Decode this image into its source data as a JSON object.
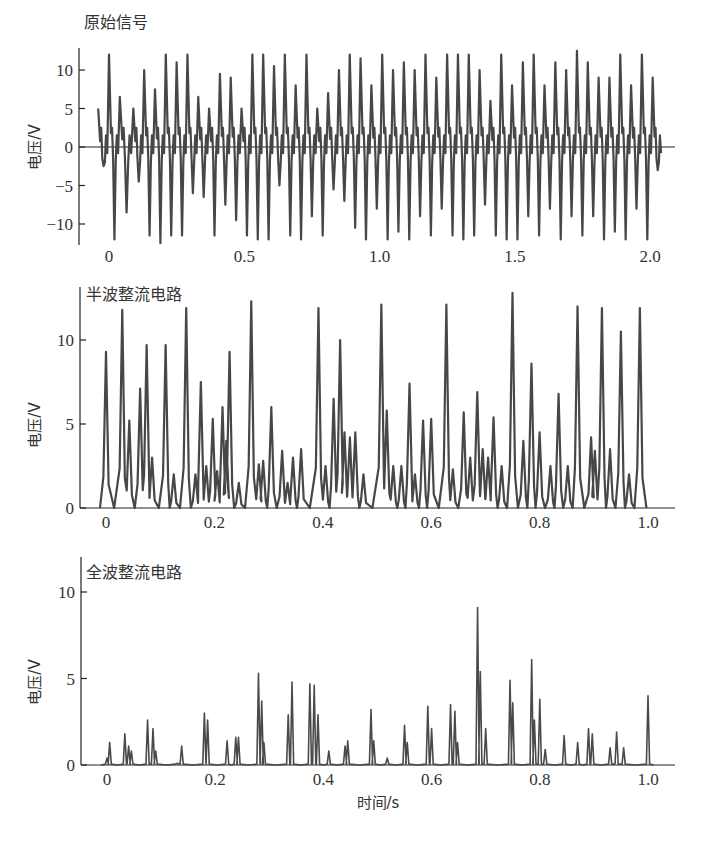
{
  "chart_data": [
    {
      "type": "line",
      "title": "原始信号",
      "xlabel": "",
      "ylabel": "电压/V",
      "xticks": [
        "0",
        "0.5",
        "1.0",
        "1.5",
        "2.0"
      ],
      "xtick_values": [
        0,
        0.5,
        1.0,
        1.5,
        2.0
      ],
      "yticks": [
        "10",
        "5",
        "0",
        "−5",
        "−10"
      ],
      "ytick_values": [
        10,
        5,
        0,
        -5,
        -10
      ],
      "xlim": [
        -0.07,
        2.07
      ],
      "ylim": [
        -13,
        13
      ],
      "grid": false,
      "zero_line": true,
      "series": [
        {
          "name": "原始信号",
          "description": "Oscillating raw voltage signal between about -12 V and +12.5 V over 0–2.0 s",
          "peaks_x": [
            -0.04,
            0.0,
            0.04,
            0.09,
            0.13,
            0.17,
            0.21,
            0.25,
            0.29,
            0.33,
            0.37,
            0.41,
            0.45,
            0.49,
            0.53,
            0.57,
            0.61,
            0.65,
            0.69,
            0.73,
            0.77,
            0.81,
            0.85,
            0.89,
            0.93,
            0.97,
            1.01,
            1.05,
            1.09,
            1.13,
            1.17,
            1.21,
            1.25,
            1.29,
            1.33,
            1.37,
            1.41,
            1.45,
            1.49,
            1.53,
            1.57,
            1.61,
            1.65,
            1.69,
            1.73,
            1.77,
            1.81,
            1.85,
            1.89,
            1.93,
            1.97,
            2.01
          ],
          "peaks_y": [
            5,
            12,
            6.5,
            5,
            10,
            7.5,
            12,
            11,
            12,
            6.5,
            5,
            9.5,
            9,
            5,
            12,
            12,
            10.5,
            12,
            8,
            12,
            5,
            7,
            10,
            12,
            11.5,
            8,
            12,
            10,
            11,
            10,
            12,
            9,
            12,
            12,
            12,
            10,
            6,
            12,
            8,
            11,
            12,
            8,
            11,
            10,
            12.5,
            11,
            9,
            9,
            12,
            8,
            12,
            9
          ],
          "troughs_y": [
            -2.5,
            -12,
            -8.5,
            -4.5,
            -11.5,
            -12.5,
            -11.5,
            -11.5,
            -6,
            -6.5,
            -11.5,
            -7.5,
            -9.5,
            -11.5,
            -12,
            -12,
            -5,
            -11.5,
            -12,
            -9,
            -11.5,
            -5.5,
            -7,
            -10.5,
            -12,
            -8,
            -12,
            -11,
            -12,
            -9,
            -11.5,
            -8,
            -11.5,
            -12,
            -11.5,
            -7.5,
            -11.5,
            -12,
            -12,
            -9,
            -11.5,
            -8,
            -12,
            -9,
            -11.5,
            -9,
            -12,
            -11,
            -12,
            -8,
            -12,
            -3
          ]
        }
      ]
    },
    {
      "type": "line",
      "title": "半波整流电路",
      "xlabel": "",
      "ylabel": "电压/V",
      "xticks": [
        "0",
        "0.2",
        "0.4",
        "0.6",
        "0.8",
        "1.0"
      ],
      "xtick_values": [
        0,
        0.2,
        0.4,
        0.6,
        0.8,
        1.0
      ],
      "yticks": [
        "10",
        "5",
        "0"
      ],
      "ytick_values": [
        10,
        5,
        0
      ],
      "xlim": [
        -0.05,
        1.05
      ],
      "ylim": [
        0,
        12.8
      ],
      "grid": false,
      "series": [
        {
          "name": "半波整流输出",
          "peaks_x": [
            0.0,
            0.03,
            0.043,
            0.063,
            0.075,
            0.085,
            0.11,
            0.125,
            0.148,
            0.165,
            0.175,
            0.185,
            0.197,
            0.205,
            0.215,
            0.222,
            0.228,
            0.245,
            0.268,
            0.282,
            0.29,
            0.305,
            0.325,
            0.335,
            0.345,
            0.36,
            0.392,
            0.405,
            0.42,
            0.432,
            0.44,
            0.45,
            0.46,
            0.475,
            0.508,
            0.518,
            0.53,
            0.545,
            0.56,
            0.57,
            0.585,
            0.6,
            0.628,
            0.64,
            0.66,
            0.672,
            0.685,
            0.695,
            0.705,
            0.715,
            0.73,
            0.75,
            0.77,
            0.785,
            0.8,
            0.82,
            0.835,
            0.852,
            0.87,
            0.895,
            0.902,
            0.915,
            0.93,
            0.95,
            0.965,
            0.985
          ],
          "peaks_y": [
            9.3,
            11.8,
            5.2,
            7.1,
            9.7,
            3,
            9.7,
            2,
            11.9,
            2,
            7.5,
            2.5,
            5.3,
            2.2,
            6,
            4,
            9.3,
            1.5,
            12.3,
            2.6,
            2.8,
            6,
            3.4,
            1.5,
            3,
            3.5,
            11.9,
            2.5,
            6.5,
            10,
            4.5,
            4.2,
            4.5,
            2,
            12.1,
            5.8,
            2.5,
            2.5,
            7.4,
            2,
            5.2,
            5.3,
            12.1,
            2.3,
            5.7,
            3,
            6.9,
            3.5,
            3,
            5.4,
            2.5,
            12.8,
            4,
            8.6,
            4.5,
            2.5,
            6.8,
            2.5,
            12,
            4.2,
            3.4,
            11.9,
            3.5,
            10.5,
            2,
            11.9
          ]
        }
      ]
    },
    {
      "type": "line",
      "title": "全波整流电路",
      "xlabel": "时间/s",
      "ylabel": "电压/V",
      "xticks": [
        "0",
        "0.2",
        "0.4",
        "0.6",
        "0.8",
        "1.0"
      ],
      "xtick_values": [
        0,
        0.2,
        0.4,
        0.6,
        0.8,
        1.0
      ],
      "yticks": [
        "10",
        "5",
        "0"
      ],
      "ytick_values": [
        10,
        5,
        0
      ],
      "xlim": [
        -0.05,
        1.05
      ],
      "ylim": [
        0,
        12
      ],
      "grid": false,
      "series": [
        {
          "name": "全波整流输出",
          "peaks_x": [
            0.0,
            0.005,
            0.033,
            0.04,
            0.045,
            0.075,
            0.085,
            0.09,
            0.13,
            0.138,
            0.18,
            0.186,
            0.222,
            0.238,
            0.243,
            0.28,
            0.286,
            0.29,
            0.335,
            0.342,
            0.375,
            0.383,
            0.39,
            0.41,
            0.44,
            0.445,
            0.488,
            0.493,
            0.518,
            0.55,
            0.555,
            0.593,
            0.6,
            0.635,
            0.643,
            0.648,
            0.685,
            0.69,
            0.7,
            0.745,
            0.75,
            0.785,
            0.79,
            0.8,
            0.81,
            0.845,
            0.87,
            0.89,
            0.897,
            0.93,
            0.942,
            0.955,
            1.0
          ],
          "peaks_y": [
            0.4,
            1.3,
            1.8,
            1.1,
            0.8,
            2.6,
            2.1,
            0.8,
            0.1,
            1.1,
            3,
            2.6,
            1.4,
            1.6,
            1.6,
            5.3,
            3.7,
            1.3,
            2.9,
            4.8,
            4.7,
            4.6,
            2.9,
            0.8,
            1.1,
            1.4,
            3.2,
            1.4,
            0.4,
            2.3,
            1.3,
            3.4,
            2.1,
            3.5,
            3.1,
            1.3,
            9.1,
            5.4,
            2.1,
            4.9,
            3.6,
            6.1,
            2.6,
            3.8,
            0.9,
            1.7,
            1.3,
            2.1,
            1.8,
            1.0,
            1.9,
            1.0,
            4
          ]
        }
      ]
    }
  ],
  "panels": {
    "raw": {
      "title": "原始信号",
      "ylabel": "电压/V"
    },
    "half": {
      "title": "半波整流电路",
      "ylabel": "电压/V"
    },
    "full": {
      "title": "全波整流电路",
      "ylabel": "电压/V",
      "xlabel": "时间/s"
    }
  },
  "colors": {
    "trace": "#474747",
    "axis": "#222222",
    "text": "#333333"
  }
}
